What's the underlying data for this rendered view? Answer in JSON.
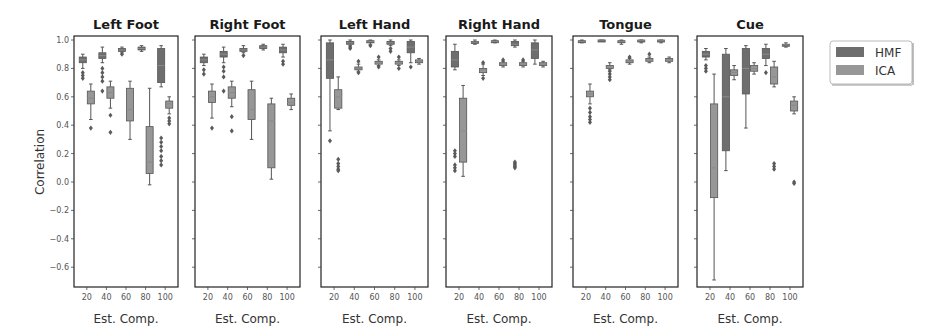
{
  "figure": {
    "ylabel": "Correlation",
    "xlabel": "Est. Comp.",
    "legend": [
      {
        "label": "HMF",
        "color": "#6e6e6e"
      },
      {
        "label": "ICA",
        "color": "#979797"
      }
    ],
    "colors": {
      "HMF": "#6e6e6e",
      "ICA": "#979797",
      "whisker": "#555555",
      "median": "#8a8a8a",
      "frame": "#222222"
    }
  },
  "chart_data": {
    "type": "boxplot",
    "ylabel": "Correlation",
    "xlabel": "Est. Comp.",
    "ylim": [
      -0.74,
      1.03
    ],
    "yticks": [
      1.0,
      0.8,
      0.6,
      0.4,
      0.2,
      0.0,
      -0.2,
      -0.4,
      -0.6
    ],
    "ytick_labels": [
      "1.0",
      "0.8",
      "0.6",
      "0.4",
      "0.2",
      "0.0",
      "−0.2",
      "−0.4",
      "−0.6"
    ],
    "categories": [
      "20",
      "40",
      "60",
      "80",
      "100"
    ],
    "legend": [
      "HMF",
      "ICA"
    ],
    "legend_position": "upper right, outside",
    "panels": [
      {
        "title": "Left Foot",
        "series": [
          {
            "name": "HMF",
            "boxes": [
              {
                "q1": 0.84,
                "median": 0.86,
                "q3": 0.88,
                "wlo": 0.8,
                "whi": 0.9,
                "outliers": [
                  0.77,
                  0.75,
                  0.73
                ]
              },
              {
                "q1": 0.87,
                "median": 0.89,
                "q3": 0.91,
                "wlo": 0.84,
                "whi": 0.95,
                "outliers": [
                  0.8,
                  0.77,
                  0.74,
                  0.71,
                  0.64
                ]
              },
              {
                "q1": 0.92,
                "median": 0.93,
                "q3": 0.94,
                "wlo": 0.91,
                "whi": 0.95,
                "outliers": [
                  0.9
                ]
              },
              {
                "q1": 0.93,
                "median": 0.94,
                "q3": 0.95,
                "wlo": 0.92,
                "whi": 0.96,
                "outliers": []
              },
              {
                "q1": 0.7,
                "median": 0.82,
                "q3": 0.94,
                "wlo": 0.67,
                "whi": 0.96,
                "outliers": [
                  0.31,
                  0.28,
                  0.25,
                  0.22,
                  0.18,
                  0.15,
                  0.12
                ]
              }
            ]
          },
          {
            "name": "ICA",
            "boxes": [
              {
                "q1": 0.55,
                "median": 0.59,
                "q3": 0.64,
                "wlo": 0.44,
                "whi": 0.69,
                "outliers": [
                  0.38
                ]
              },
              {
                "q1": 0.59,
                "median": 0.63,
                "q3": 0.67,
                "wlo": 0.52,
                "whi": 0.71,
                "outliers": [
                  0.47,
                  0.35
                ]
              },
              {
                "q1": 0.43,
                "median": 0.51,
                "q3": 0.66,
                "wlo": 0.3,
                "whi": 0.71,
                "outliers": []
              },
              {
                "q1": 0.06,
                "median": 0.14,
                "q3": 0.39,
                "wlo": -0.02,
                "whi": 0.66,
                "outliers": []
              },
              {
                "q1": 0.52,
                "median": 0.55,
                "q3": 0.57,
                "wlo": 0.48,
                "whi": 0.6,
                "outliers": [
                  0.45,
                  0.43,
                  0.41
                ]
              }
            ]
          }
        ]
      },
      {
        "title": "Right Foot",
        "series": [
          {
            "name": "HMF",
            "boxes": [
              {
                "q1": 0.84,
                "median": 0.86,
                "q3": 0.88,
                "wlo": 0.82,
                "whi": 0.9,
                "outliers": [
                  0.79,
                  0.76
                ]
              },
              {
                "q1": 0.88,
                "median": 0.9,
                "q3": 0.92,
                "wlo": 0.84,
                "whi": 0.95,
                "outliers": [
                  0.81,
                  0.78,
                  0.74,
                  0.64
                ]
              },
              {
                "q1": 0.92,
                "median": 0.93,
                "q3": 0.94,
                "wlo": 0.91,
                "whi": 0.96,
                "outliers": [
                  0.89
                ]
              },
              {
                "q1": 0.94,
                "median": 0.95,
                "q3": 0.96,
                "wlo": 0.93,
                "whi": 0.97,
                "outliers": []
              },
              {
                "q1": 0.91,
                "median": 0.93,
                "q3": 0.95,
                "wlo": 0.88,
                "whi": 0.97,
                "outliers": [
                  0.85,
                  0.83
                ]
              }
            ]
          },
          {
            "name": "ICA",
            "boxes": [
              {
                "q1": 0.56,
                "median": 0.6,
                "q3": 0.64,
                "wlo": 0.45,
                "whi": 0.69,
                "outliers": [
                  0.38
                ]
              },
              {
                "q1": 0.59,
                "median": 0.63,
                "q3": 0.67,
                "wlo": 0.53,
                "whi": 0.71,
                "outliers": [
                  0.46,
                  0.36
                ]
              },
              {
                "q1": 0.44,
                "median": 0.51,
                "q3": 0.65,
                "wlo": 0.3,
                "whi": 0.71,
                "outliers": []
              },
              {
                "q1": 0.1,
                "median": 0.43,
                "q3": 0.55,
                "wlo": 0.02,
                "whi": 0.59,
                "outliers": []
              },
              {
                "q1": 0.54,
                "median": 0.56,
                "q3": 0.59,
                "wlo": 0.51,
                "whi": 0.62,
                "outliers": []
              }
            ]
          }
        ]
      },
      {
        "title": "Left Hand",
        "series": [
          {
            "name": "HMF",
            "boxes": [
              {
                "q1": 0.73,
                "median": 0.86,
                "q3": 0.98,
                "wlo": 0.36,
                "whi": 1.0,
                "outliers": [
                  0.29
                ]
              },
              {
                "q1": 0.97,
                "median": 0.98,
                "q3": 0.99,
                "wlo": 0.96,
                "whi": 1.0,
                "outliers": [
                  0.95,
                  0.94
                ]
              },
              {
                "q1": 0.98,
                "median": 0.99,
                "q3": 0.995,
                "wlo": 0.97,
                "whi": 1.0,
                "outliers": [
                  0.96
                ]
              },
              {
                "q1": 0.97,
                "median": 0.98,
                "q3": 0.99,
                "wlo": 0.96,
                "whi": 1.0,
                "outliers": [
                  0.94,
                  0.92
                ]
              },
              {
                "q1": 0.91,
                "median": 0.95,
                "q3": 0.99,
                "wlo": 0.84,
                "whi": 1.0,
                "outliers": [
                  0.81
                ]
              }
            ]
          },
          {
            "name": "ICA",
            "boxes": [
              {
                "q1": 0.52,
                "median": 0.6,
                "q3": 0.65,
                "wlo": 0.51,
                "whi": 0.74,
                "outliers": [
                  0.16,
                  0.13,
                  0.11,
                  0.09,
                  0.08
                ]
              },
              {
                "q1": 0.79,
                "median": 0.8,
                "q3": 0.81,
                "wlo": 0.78,
                "whi": 0.83,
                "outliers": [
                  0.85,
                  0.77
                ]
              },
              {
                "q1": 0.83,
                "median": 0.84,
                "q3": 0.85,
                "wlo": 0.82,
                "whi": 0.86,
                "outliers": [
                  0.88,
                  0.81
                ]
              },
              {
                "q1": 0.83,
                "median": 0.84,
                "q3": 0.85,
                "wlo": 0.82,
                "whi": 0.86,
                "outliers": [
                  0.88,
                  0.8
                ]
              },
              {
                "q1": 0.84,
                "median": 0.85,
                "q3": 0.86,
                "wlo": 0.83,
                "whi": 0.87,
                "outliers": []
              }
            ]
          }
        ]
      },
      {
        "title": "Right Hand",
        "series": [
          {
            "name": "HMF",
            "boxes": [
              {
                "q1": 0.81,
                "median": 0.86,
                "q3": 0.92,
                "wlo": 0.79,
                "whi": 0.97,
                "outliers": [
                  0.22,
                  0.2,
                  0.18,
                  0.12,
                  0.1,
                  0.08
                ]
              },
              {
                "q1": 0.98,
                "median": 0.985,
                "q3": 0.99,
                "wlo": 0.97,
                "whi": 1.0,
                "outliers": []
              },
              {
                "q1": 0.985,
                "median": 0.99,
                "q3": 0.995,
                "wlo": 0.98,
                "whi": 1.0,
                "outliers": []
              },
              {
                "q1": 0.96,
                "median": 0.97,
                "q3": 0.99,
                "wlo": 0.95,
                "whi": 1.0,
                "outliers": [
                  0.14,
                  0.13,
                  0.12,
                  0.11,
                  0.1
                ]
              },
              {
                "q1": 0.87,
                "median": 0.93,
                "q3": 0.98,
                "wlo": 0.83,
                "whi": 1.0,
                "outliers": []
              }
            ]
          },
          {
            "name": "ICA",
            "boxes": [
              {
                "q1": 0.14,
                "median": 0.36,
                "q3": 0.59,
                "wlo": 0.04,
                "whi": 0.68,
                "outliers": []
              },
              {
                "q1": 0.77,
                "median": 0.79,
                "q3": 0.8,
                "wlo": 0.75,
                "whi": 0.83,
                "outliers": [
                  0.84,
                  0.73
                ]
              },
              {
                "q1": 0.82,
                "median": 0.83,
                "q3": 0.84,
                "wlo": 0.81,
                "whi": 0.85,
                "outliers": [
                  0.86
                ]
              },
              {
                "q1": 0.82,
                "median": 0.83,
                "q3": 0.84,
                "wlo": 0.81,
                "whi": 0.85,
                "outliers": [
                  0.86
                ]
              },
              {
                "q1": 0.82,
                "median": 0.83,
                "q3": 0.84,
                "wlo": 0.81,
                "whi": 0.85,
                "outliers": []
              }
            ]
          }
        ]
      },
      {
        "title": "Tongue",
        "series": [
          {
            "name": "HMF",
            "boxes": [
              {
                "q1": 0.985,
                "median": 0.99,
                "q3": 0.995,
                "wlo": 0.98,
                "whi": 1.0,
                "outliers": []
              },
              {
                "q1": 0.995,
                "median": 1.0,
                "q3": 1.0,
                "wlo": 0.99,
                "whi": 1.0,
                "outliers": []
              },
              {
                "q1": 0.985,
                "median": 0.99,
                "q3": 0.995,
                "wlo": 0.97,
                "whi": 1.0,
                "outliers": []
              },
              {
                "q1": 0.99,
                "median": 0.995,
                "q3": 1.0,
                "wlo": 0.98,
                "whi": 1.0,
                "outliers": []
              },
              {
                "q1": 0.99,
                "median": 0.995,
                "q3": 1.0,
                "wlo": 0.98,
                "whi": 1.0,
                "outliers": []
              }
            ]
          },
          {
            "name": "ICA",
            "boxes": [
              {
                "q1": 0.6,
                "median": 0.62,
                "q3": 0.64,
                "wlo": 0.55,
                "whi": 0.69,
                "outliers": [
                  0.52,
                  0.49,
                  0.46,
                  0.44,
                  0.42
                ]
              },
              {
                "q1": 0.8,
                "median": 0.81,
                "q3": 0.82,
                "wlo": 0.79,
                "whi": 0.84,
                "outliers": [
                  0.78,
                  0.76,
                  0.74,
                  0.72
                ]
              },
              {
                "q1": 0.84,
                "median": 0.85,
                "q3": 0.86,
                "wlo": 0.83,
                "whi": 0.87,
                "outliers": [
                  0.88
                ]
              },
              {
                "q1": 0.85,
                "median": 0.86,
                "q3": 0.87,
                "wlo": 0.84,
                "whi": 0.88,
                "outliers": [
                  0.9
                ]
              },
              {
                "q1": 0.85,
                "median": 0.86,
                "q3": 0.87,
                "wlo": 0.84,
                "whi": 0.88,
                "outliers": []
              }
            ]
          }
        ]
      },
      {
        "title": "Cue",
        "series": [
          {
            "name": "HMF",
            "boxes": [
              {
                "q1": 0.88,
                "median": 0.9,
                "q3": 0.92,
                "wlo": 0.86,
                "whi": 0.94,
                "outliers": [
                  0.82,
                  0.8,
                  0.78
                ]
              },
              {
                "q1": 0.22,
                "median": 0.6,
                "q3": 0.9,
                "wlo": 0.08,
                "whi": 0.94,
                "outliers": []
              },
              {
                "q1": 0.62,
                "median": 0.8,
                "q3": 0.94,
                "wlo": 0.38,
                "whi": 0.96,
                "outliers": []
              },
              {
                "q1": 0.87,
                "median": 0.9,
                "q3": 0.94,
                "wlo": 0.82,
                "whi": 0.97,
                "outliers": [
                  0.77
                ]
              },
              {
                "q1": 0.96,
                "median": 0.965,
                "q3": 0.97,
                "wlo": 0.95,
                "whi": 0.98,
                "outliers": []
              }
            ]
          },
          {
            "name": "ICA",
            "boxes": [
              {
                "q1": -0.11,
                "median": 0.1,
                "q3": 0.55,
                "wlo": -0.69,
                "whi": 0.76,
                "outliers": []
              },
              {
                "q1": 0.75,
                "median": 0.77,
                "q3": 0.79,
                "wlo": 0.72,
                "whi": 0.82,
                "outliers": []
              },
              {
                "q1": 0.78,
                "median": 0.8,
                "q3": 0.82,
                "wlo": 0.76,
                "whi": 0.84,
                "outliers": []
              },
              {
                "q1": 0.69,
                "median": 0.74,
                "q3": 0.81,
                "wlo": 0.67,
                "whi": 0.85,
                "outliers": [
                  0.13,
                  0.11,
                  0.09
                ]
              },
              {
                "q1": 0.5,
                "median": 0.54,
                "q3": 0.57,
                "wlo": 0.48,
                "whi": 0.6,
                "outliers": [
                  0.0,
                  -0.01
                ]
              }
            ]
          }
        ]
      }
    ]
  }
}
